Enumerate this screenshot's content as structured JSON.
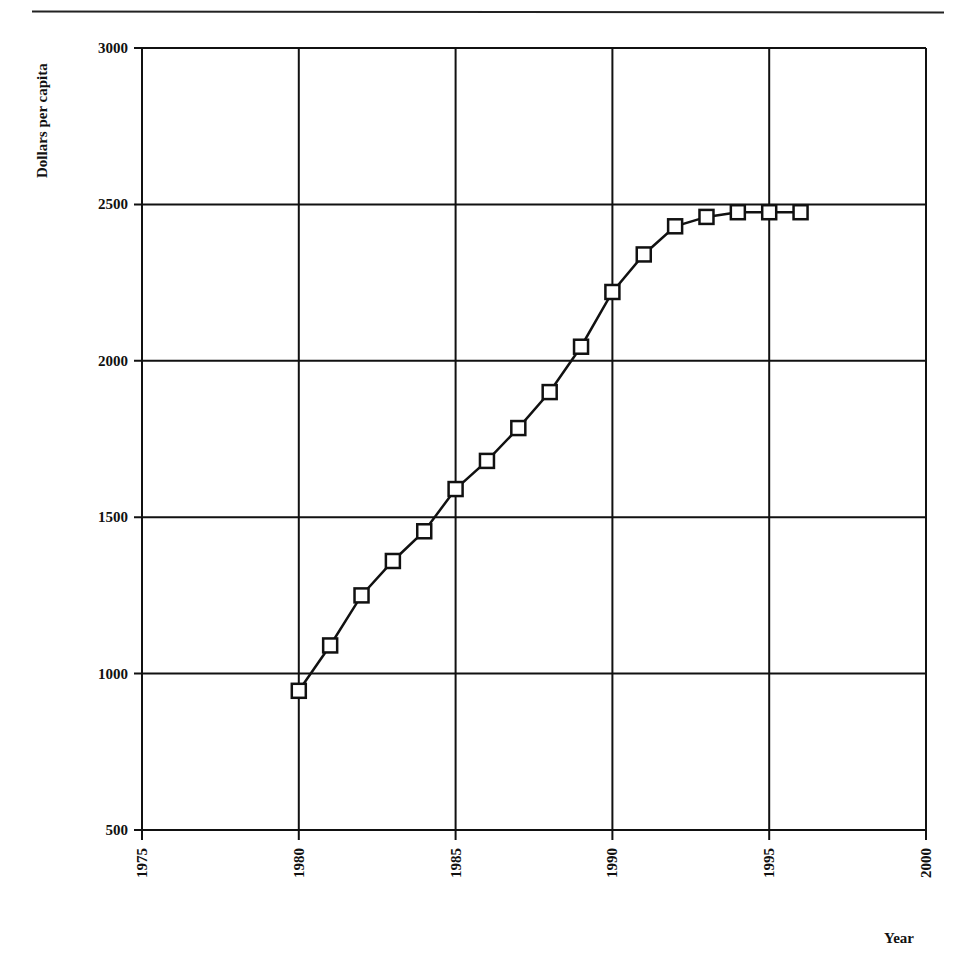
{
  "chart_data": {
    "type": "line",
    "title": "",
    "xlabel": "Year",
    "ylabel": "Dollars per capita",
    "xlim": [
      1975,
      2000
    ],
    "ylim": [
      500,
      3000
    ],
    "x_ticks": [
      "1975",
      "1980",
      "1985",
      "1990",
      "1995",
      "2000"
    ],
    "y_ticks": [
      "500",
      "1000",
      "1500",
      "2000",
      "2500",
      "3000"
    ],
    "grid": true,
    "legend": null,
    "marker": "open-square",
    "line_color": "#111111",
    "series": [
      {
        "name": "Dollars per capita",
        "x": [
          1980,
          1981,
          1982,
          1983,
          1984,
          1985,
          1986,
          1987,
          1988,
          1989,
          1990,
          1991,
          1992,
          1993,
          1994,
          1995,
          1996
        ],
        "values": [
          945,
          1090,
          1250,
          1360,
          1455,
          1590,
          1680,
          1785,
          1900,
          2045,
          2220,
          2340,
          2430,
          2460,
          2475,
          2475,
          2475
        ]
      }
    ]
  },
  "labels": {
    "ylabel": "Dollars per capita",
    "xlabel": "Year"
  }
}
